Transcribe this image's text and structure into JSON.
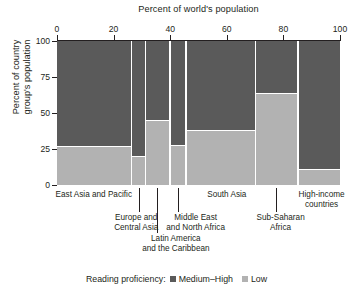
{
  "chart_data": {
    "type": "bar",
    "variant": "marimekko-mosaic",
    "title": "Percent of world's population",
    "xlabel": "Percent of world's population",
    "ylabel": "Percent of country group's population",
    "xlim": [
      0,
      100
    ],
    "ylim": [
      0,
      100
    ],
    "xticks": [
      0,
      20,
      40,
      60,
      80,
      100
    ],
    "xticklabels": [
      "0",
      "20",
      "40",
      "60",
      "80",
      "100"
    ],
    "yticks": [
      0,
      25,
      50,
      75,
      100
    ],
    "yticklabels": [
      "0",
      "25",
      "50",
      "75",
      "100"
    ],
    "grid": false,
    "legend_position": "bottom-center",
    "legend_title": "Reading proficiency:",
    "series": [
      {
        "name": "Medium–High",
        "color": "#5a5a5a",
        "values": [
          73,
          80,
          55,
          72,
          62,
          36,
          89
        ]
      },
      {
        "name": "Low",
        "color": "#b2b2b2",
        "values": [
          27,
          20,
          45,
          28,
          38,
          64,
          11
        ]
      }
    ],
    "categories": [
      "East Asia and Pacific",
      "Europe and\nCentral Asia",
      "Latin America\nand the Caribbean",
      "Middle East\nand North Africa",
      "South Asia",
      "Sub-Saharan\nAfrica",
      "High-income\ncountries"
    ],
    "column_widths_pct": [
      26.0,
      4.5,
      8.0,
      5.0,
      24.0,
      14.5,
      18.0
    ],
    "column_x_start_pct": [
      0.0,
      26.6,
      31.6,
      40.2,
      45.8,
      70.4,
      85.5
    ],
    "column_x_end_pct": [
      26.0,
      31.1,
      39.6,
      45.2,
      69.8,
      84.9,
      100.0
    ]
  },
  "chart": {
    "title": "Percent of world's population",
    "yaxis_title": "Percent of country\ngroup's population"
  },
  "xaxis": {
    "ticks": [
      {
        "label": "0",
        "pos": 0
      },
      {
        "label": "20",
        "pos": 20
      },
      {
        "label": "40",
        "pos": 40
      },
      {
        "label": "60",
        "pos": 60
      },
      {
        "label": "80",
        "pos": 80
      },
      {
        "label": "100",
        "pos": 100
      }
    ]
  },
  "yaxis": {
    "ticks": [
      {
        "label": "100",
        "pos": 100
      },
      {
        "label": "75",
        "pos": 75
      },
      {
        "label": "50",
        "pos": 50
      },
      {
        "label": "25",
        "pos": 25
      },
      {
        "label": "0",
        "pos": 0
      }
    ]
  },
  "columns": [
    {
      "key": "east-asia-and-pacific",
      "label": "East Asia and Pacific",
      "x_start": 0.0,
      "x_end": 26.0,
      "medium_high": 73,
      "low": 27,
      "label_cx": 13.0,
      "label_top": 4,
      "label_width": 100,
      "leader": null
    },
    {
      "key": "europe-and-central-asia",
      "label": "Europe and\nCentral Asia",
      "x_start": 26.6,
      "x_end": 31.1,
      "medium_high": 80,
      "low": 20,
      "label_cx": 28.0,
      "label_top": 27,
      "label_width": 76,
      "leader": {
        "x": 28.8,
        "top": 2,
        "height": 24
      }
    },
    {
      "key": "latin-america-and-the-caribbean",
      "label": "Latin America\nand the Caribbean",
      "x_start": 31.6,
      "x_end": 39.6,
      "medium_high": 55,
      "low": 45,
      "label_cx": 42.0,
      "label_top": 48,
      "label_width": 104,
      "leader": {
        "x": 35.5,
        "top": 2,
        "height": 45
      }
    },
    {
      "key": "middle-east-and-north-africa",
      "label": "Middle East\nand North Africa",
      "x_start": 40.2,
      "x_end": 45.2,
      "medium_high": 72,
      "low": 28,
      "label_cx": 49.0,
      "label_top": 27,
      "label_width": 96,
      "leader": {
        "x": 42.8,
        "top": 2,
        "height": 24
      }
    },
    {
      "key": "south-asia",
      "label": "South Asia",
      "x_start": 45.8,
      "x_end": 69.8,
      "medium_high": 62,
      "low": 38,
      "label_cx": 60.0,
      "label_top": 4,
      "label_width": 70,
      "leader": null
    },
    {
      "key": "sub-saharan-africa",
      "label": "Sub-Saharan\nAfrica",
      "x_start": 70.4,
      "x_end": 84.9,
      "medium_high": 36,
      "low": 64,
      "label_cx": 79.0,
      "label_top": 27,
      "label_width": 78,
      "leader": {
        "x": 77.4,
        "top": 2,
        "height": 24
      }
    },
    {
      "key": "high-income-countries",
      "label": "High-income\ncountries",
      "x_start": 85.5,
      "x_end": 100.0,
      "medium_high": 89,
      "low": 11,
      "label_cx": 93.5,
      "label_top": 4,
      "label_width": 78,
      "leader": null
    }
  ],
  "legend": {
    "title": "Reading proficiency:",
    "entries": [
      {
        "label": "Medium–High",
        "color": "#5a5a5a",
        "key": "medium-high"
      },
      {
        "label": "Low",
        "color": "#b2b2b2",
        "key": "low"
      }
    ]
  },
  "colors": {
    "medium_high": "#5a5a5a",
    "low": "#b2b2b2",
    "axis": "#231f20",
    "background": "#ffffff"
  }
}
